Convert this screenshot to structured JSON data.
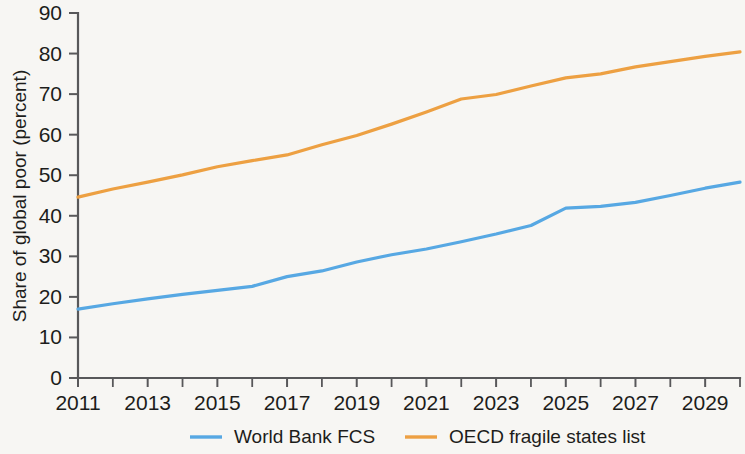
{
  "chart_data": {
    "type": "line",
    "title": "",
    "subtitle": "",
    "xlabel": "",
    "ylabel": "Share of global poor (percent)",
    "xlim": [
      2011,
      2030
    ],
    "ylim": [
      0,
      90
    ],
    "ytick_step": 10,
    "yticks": [
      "0",
      "10",
      "20",
      "30",
      "40",
      "50",
      "60",
      "70",
      "80",
      "90"
    ],
    "xticks_major": [
      "2011",
      "2013",
      "2015",
      "2017",
      "2019",
      "2021",
      "2023",
      "2025",
      "2027",
      "2029"
    ],
    "xticks_minor": [
      "2012",
      "2014",
      "2016",
      "2018",
      "2020",
      "2022",
      "2024",
      "2026",
      "2028",
      "2030"
    ],
    "grid": false,
    "legend_position": "bottom",
    "x": [
      2011,
      2012,
      2013,
      2014,
      2015,
      2016,
      2017,
      2018,
      2019,
      2020,
      2021,
      2022,
      2023,
      2024,
      2025,
      2026,
      2027,
      2028,
      2029,
      2030
    ],
    "series": [
      {
        "name": "World Bank FCS",
        "color": "#57a8e3",
        "values": [
          17.0,
          18.3,
          19.5,
          20.6,
          21.6,
          22.6,
          25.0,
          26.4,
          28.6,
          30.4,
          31.8,
          33.6,
          35.5,
          37.6,
          41.9,
          42.3,
          43.3,
          45.0,
          46.8,
          48.3
        ]
      },
      {
        "name": "OECD fragile states list",
        "color": "#eda042",
        "values": [
          44.6,
          46.6,
          48.3,
          50.1,
          52.1,
          53.6,
          55.0,
          57.5,
          59.8,
          62.6,
          65.6,
          68.8,
          69.9,
          72.0,
          74.0,
          75.0,
          76.7,
          78.0,
          79.3,
          80.4
        ]
      }
    ]
  },
  "legend": {
    "items": [
      {
        "label": "World Bank FCS",
        "color": "#57a8e3"
      },
      {
        "label": "OECD fragile states list",
        "color": "#eda042"
      }
    ]
  },
  "colors": {
    "background": "#f7f6f3",
    "axis": "#58585a",
    "text": "#1d1d1b",
    "series_blue": "#57a8e3",
    "series_orange": "#eda042"
  }
}
